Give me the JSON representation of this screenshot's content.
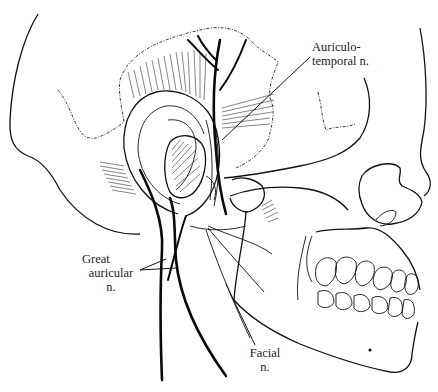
{
  "figure": {
    "labels": {
      "auriculotemporal": {
        "line1": "Auriculo-",
        "line2": "temporal n."
      },
      "great_auricular": {
        "line1": "Great",
        "line2": "auricular",
        "line3": "n."
      },
      "facial": {
        "line1": "Facial",
        "line2": "n."
      }
    },
    "colors": {
      "ink": "#111111",
      "background": "#ffffff"
    }
  }
}
